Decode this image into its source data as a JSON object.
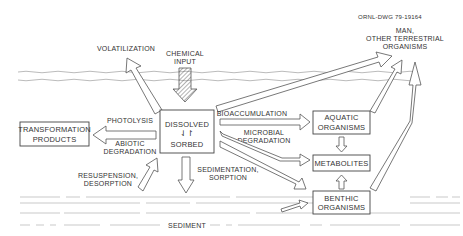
{
  "drawing_id": "ORNL-DWG 79-19164",
  "nodes": {
    "chemical_input": [
      "CHEMICAL",
      "INPUT"
    ],
    "dissolved_sorbed": [
      "DISSOLVED",
      "⇃↾",
      "SORBED"
    ],
    "transformation_products": [
      "TRANSFORMATION",
      "PRODUCTS"
    ],
    "aquatic_organisms": [
      "AQUATIC",
      "ORGANISMS"
    ],
    "metabolites": [
      "METABOLITES"
    ],
    "benthic_organisms": [
      "BENTHIC",
      "ORGANISMS"
    ],
    "man_terrestrial": [
      "MAN,",
      "OTHER TERRESTRIAL",
      "ORGANISMS"
    ]
  },
  "processes": {
    "volatilization": "VOLATILIZATION",
    "photolysis": "PHOTOLYSIS",
    "abiotic_degradation": [
      "ABIOTIC",
      "DEGRADATION"
    ],
    "bioaccumulation": "BIOACCUMULATION",
    "microbial_degradation": [
      "MICROBIAL",
      "DEGRADATION"
    ],
    "sedimentation_sorption": [
      "SEDIMENTATION,",
      "SORPTION"
    ],
    "resuspension_desorption": [
      "RESUSPENSION,",
      "DESORPTION"
    ]
  },
  "zones": {
    "sediment": "SEDIMENT"
  }
}
